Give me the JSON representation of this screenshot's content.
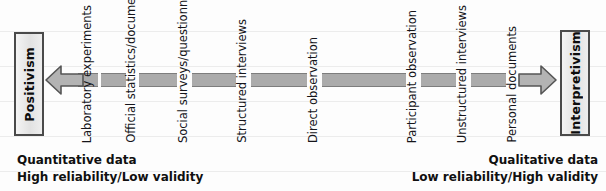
{
  "diagram": {
    "endpoints": {
      "left": {
        "label": "Positivism"
      },
      "right": {
        "label": "Interpretivism"
      }
    },
    "methods": [
      {
        "label": "Laboratory experiments",
        "x": 88
      },
      {
        "label": "Official statistics/documents",
        "x": 132
      },
      {
        "label": "Social surveys/questionnaires",
        "x": 184
      },
      {
        "label": "Structured interviews",
        "x": 243
      },
      {
        "label": "Direct observation",
        "x": 314
      },
      {
        "label": "Participant observation",
        "x": 413
      },
      {
        "label": "Unstructured interviews",
        "x": 463
      },
      {
        "label": "Personal documents",
        "x": 513
      }
    ],
    "descriptors": {
      "left": {
        "line1": "Quantitative data",
        "line2": "High reliability/Low validity"
      },
      "right": {
        "line1": "Qualitative data",
        "line2": "Low reliability/High validity"
      }
    },
    "colors": {
      "bar_fill": "#ababab",
      "bar_edge": "#7d7d7d",
      "box_border": "#4a4a4a",
      "arrow_fill": "#b3b3b3",
      "arrow_edge": "#555555",
      "text": "#101010",
      "background": "#fdfdfd"
    }
  }
}
